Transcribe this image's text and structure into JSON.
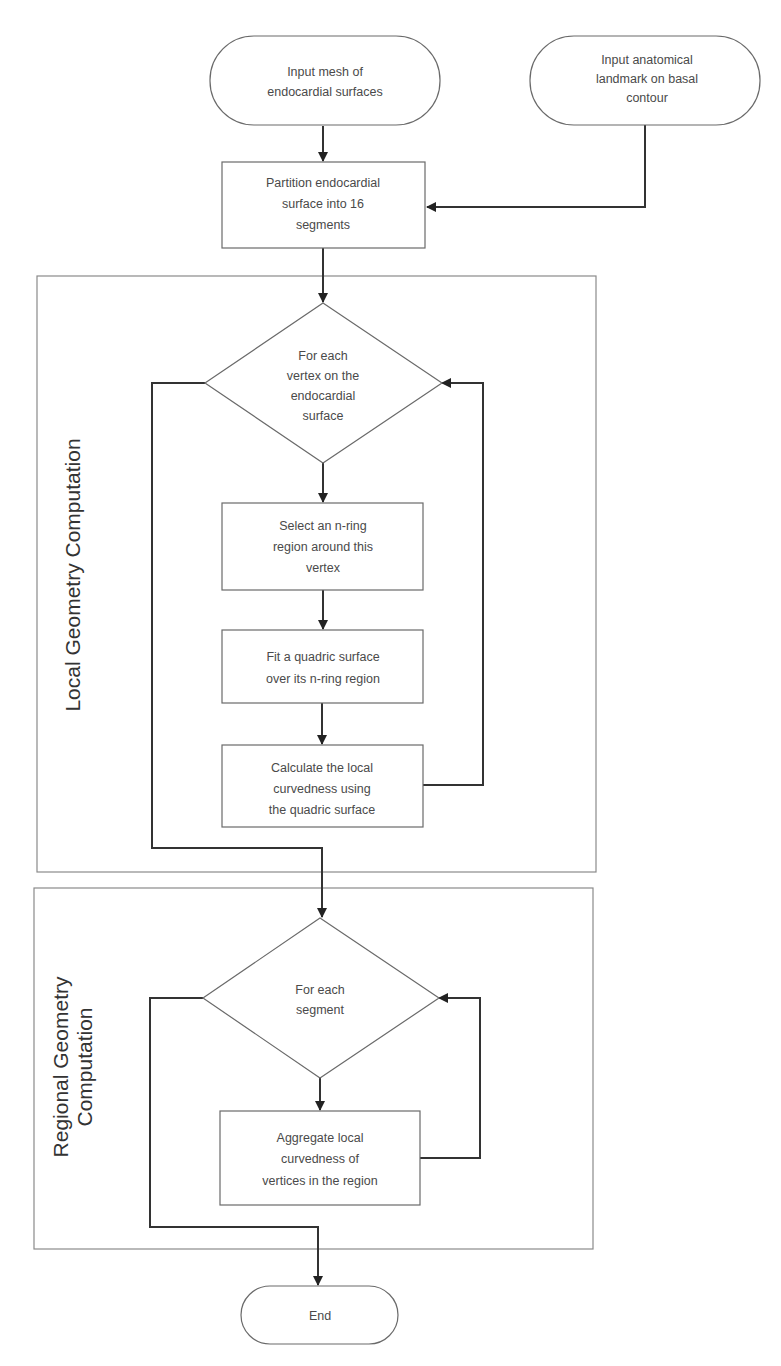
{
  "diagram": {
    "type": "flowchart",
    "nodes": {
      "input_mesh": {
        "shape": "terminal",
        "lines": [
          "Input mesh of",
          "endocardial surfaces"
        ]
      },
      "input_landmark": {
        "shape": "terminal",
        "lines": [
          "Input anatomical",
          "landmark on basal",
          "contour"
        ]
      },
      "partition": {
        "shape": "process",
        "lines": [
          "Partition endocardial",
          "surface into 16",
          "segments"
        ]
      },
      "for_each_vertex": {
        "shape": "decision",
        "lines": [
          "For each",
          "vertex on the",
          "endocardial",
          "surface"
        ]
      },
      "select_ring": {
        "shape": "process",
        "lines": [
          "Select an n-ring",
          "region around this",
          "vertex"
        ]
      },
      "fit_quadric": {
        "shape": "process",
        "lines": [
          "Fit a quadric surface",
          "over its n-ring region"
        ]
      },
      "calc_curvedness": {
        "shape": "process",
        "lines": [
          "Calculate the local",
          "curvedness using",
          "the quadric surface"
        ]
      },
      "for_each_segment": {
        "shape": "decision",
        "lines": [
          "For each",
          "segment"
        ]
      },
      "aggregate": {
        "shape": "process",
        "lines": [
          "Aggregate local",
          "curvedness of",
          "vertices in the region"
        ]
      },
      "end": {
        "shape": "terminal",
        "lines": [
          "End"
        ]
      }
    },
    "frames": {
      "local": {
        "label": "Local Geometry Computation"
      },
      "regional": {
        "label_lines": [
          "Regional Geometry",
          "Computation"
        ]
      }
    },
    "edges": [
      {
        "from": "input_mesh",
        "to": "partition"
      },
      {
        "from": "input_landmark",
        "to": "partition"
      },
      {
        "from": "partition",
        "to": "for_each_vertex"
      },
      {
        "from": "for_each_vertex",
        "to": "select_ring"
      },
      {
        "from": "select_ring",
        "to": "fit_quadric"
      },
      {
        "from": "fit_quadric",
        "to": "calc_curvedness"
      },
      {
        "from": "calc_curvedness",
        "to": "for_each_vertex",
        "type": "loop"
      },
      {
        "from": "for_each_vertex",
        "to": "for_each_segment",
        "type": "exit"
      },
      {
        "from": "for_each_segment",
        "to": "aggregate"
      },
      {
        "from": "aggregate",
        "to": "for_each_segment",
        "type": "loop"
      },
      {
        "from": "for_each_segment",
        "to": "end",
        "type": "exit"
      }
    ]
  }
}
